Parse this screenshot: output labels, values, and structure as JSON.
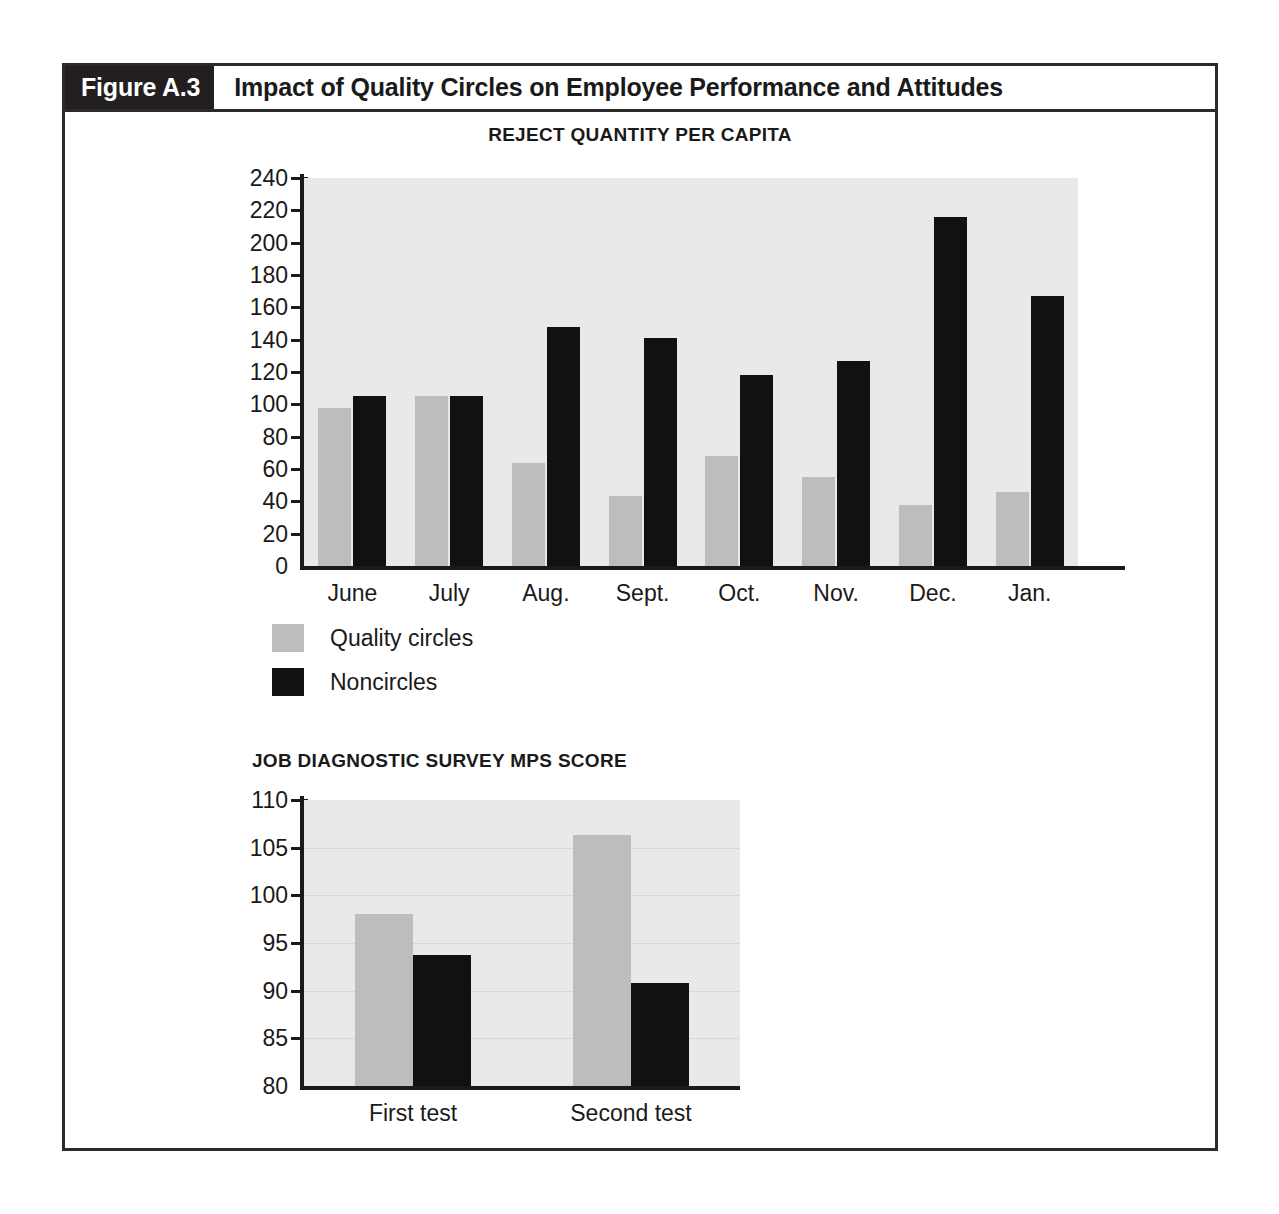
{
  "figure": {
    "tag": "Figure A.3",
    "title": "Impact of Quality Circles on Employee Performance and Attitudes"
  },
  "colors": {
    "series_a": "#bdbdbd",
    "series_b": "#111111",
    "plot_background": "#e9e9e9",
    "header_tag_background": "#231f20",
    "frame_border": "#2b2b2b",
    "text": "#1a1a1a"
  },
  "legend": {
    "items": [
      {
        "label": "Quality circles",
        "swatch": "series-a"
      },
      {
        "label": "Noncircles",
        "swatch": "series-b"
      }
    ]
  },
  "chart_data": [
    {
      "type": "bar",
      "title": "REJECT QUANTITY PER CAPITA",
      "xlabel": "",
      "ylabel": "",
      "ylim": [
        0,
        240
      ],
      "ytick_step": 20,
      "yticks": [
        0,
        20,
        40,
        60,
        80,
        100,
        120,
        140,
        160,
        180,
        200,
        220,
        240
      ],
      "ytick_labels": [
        "0",
        "20",
        "40",
        "60",
        "80",
        "100",
        "120",
        "140",
        "160",
        "180",
        "200",
        "220",
        "240"
      ],
      "grid": false,
      "legend_position": "below-left",
      "categories": [
        "June",
        "July",
        "Aug.",
        "Sept.",
        "Oct.",
        "Nov.",
        "Dec.",
        "Jan."
      ],
      "series": [
        {
          "name": "Quality circles",
          "values": [
            98,
            105,
            64,
            43,
            68,
            55,
            38,
            46
          ]
        },
        {
          "name": "Noncircles",
          "values": [
            105,
            105,
            148,
            141,
            118,
            127,
            216,
            167
          ]
        }
      ]
    },
    {
      "type": "bar",
      "title": "JOB DIAGNOSTIC SURVEY MPS SCORE",
      "xlabel": "",
      "ylabel": "",
      "ylim": [
        80,
        110
      ],
      "ytick_step": 5,
      "yticks": [
        80,
        85,
        90,
        95,
        100,
        105,
        110
      ],
      "ytick_labels": [
        "80",
        "85",
        "90",
        "95",
        "100",
        "105",
        "110"
      ],
      "grid": true,
      "legend_position": "none",
      "categories": [
        "First test",
        "Second test"
      ],
      "series": [
        {
          "name": "Quality circles",
          "values": [
            98.0,
            106.3
          ]
        },
        {
          "name": "Noncircles",
          "values": [
            93.7,
            90.8
          ]
        }
      ]
    }
  ]
}
